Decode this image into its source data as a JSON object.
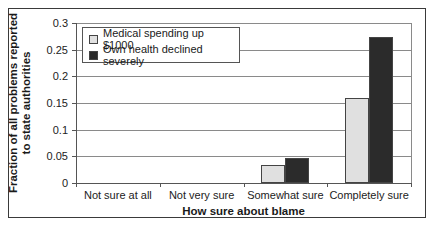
{
  "chart_data": {
    "type": "bar",
    "title": "",
    "xlabel": "How sure about blame",
    "ylabel": "Fraction of all problems reported to state authorities",
    "ylabel_lines": [
      "Fraction of all problems reported",
      "to state authorities"
    ],
    "ylim": [
      0,
      0.3
    ],
    "yticks": [
      "0",
      "0.05",
      "0.1",
      "0.15",
      "0.2",
      "0.25",
      "0.3"
    ],
    "grid": true,
    "legend_position": "top-left inside",
    "categories": [
      "Not sure at all",
      "Not very sure",
      "Somewhat sure",
      "Completely sure"
    ],
    "series": [
      {
        "name": "Medical spending up $1000",
        "color": "#e0e0e0",
        "values": [
          0,
          0,
          0.034,
          0.159
        ]
      },
      {
        "name": "Own health declined severely",
        "color": "#2b2b2b",
        "values": [
          0,
          0,
          0.047,
          0.274
        ]
      }
    ]
  }
}
